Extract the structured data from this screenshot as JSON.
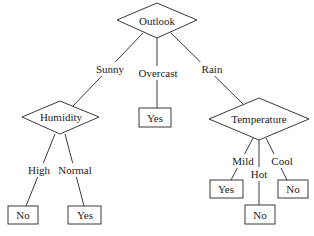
{
  "diagram": {
    "type": "decision-tree",
    "root": {
      "id": "outlook",
      "label": "Outlook",
      "shape": "diamond"
    },
    "edges": {
      "sunny": "Sunny",
      "overcast": "Overcast",
      "rain": "Rain",
      "high": "High",
      "normal": "Normal",
      "mild": "Mild",
      "hot": "Hot",
      "cool": "Cool"
    },
    "nodes": {
      "humidity": "Humidity",
      "temperature": "Temperature",
      "overcast_leaf": "Yes",
      "high_leaf": "No",
      "normal_leaf": "Yes",
      "mild_leaf": "Yes",
      "hot_leaf": "No",
      "cool_leaf": "No"
    },
    "structure": [
      {
        "parent": "Outlook",
        "edge": "Sunny",
        "child": "Humidity"
      },
      {
        "parent": "Outlook",
        "edge": "Overcast",
        "child": "Yes"
      },
      {
        "parent": "Outlook",
        "edge": "Rain",
        "child": "Temperature"
      },
      {
        "parent": "Humidity",
        "edge": "High",
        "child": "No"
      },
      {
        "parent": "Humidity",
        "edge": "Normal",
        "child": "Yes"
      },
      {
        "parent": "Temperature",
        "edge": "Mild",
        "child": "Yes"
      },
      {
        "parent": "Temperature",
        "edge": "Hot",
        "child": "No"
      },
      {
        "parent": "Temperature",
        "edge": "Cool",
        "child": "No"
      }
    ]
  }
}
